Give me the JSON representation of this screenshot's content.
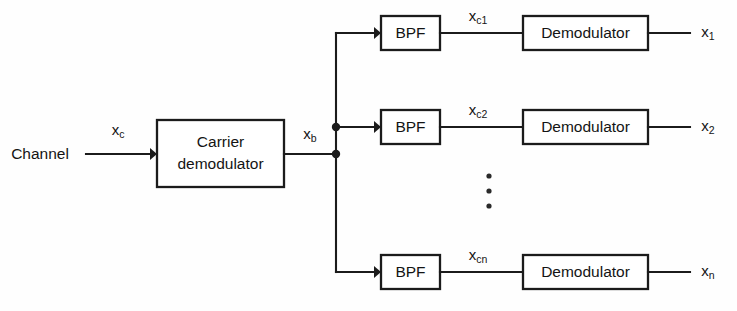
{
  "diagram": {
    "background_color": "#fefefe",
    "line_color": "#1b1b1b",
    "box_fill_color": "#ffffff",
    "input": {
      "source_label": "Channel",
      "signal_label": "x",
      "signal_subscript": "c"
    },
    "carrier_stage": {
      "line1": "Carrier",
      "line2": "demodulator",
      "output_signal_label": "x",
      "output_signal_subscript": "b"
    },
    "branch_filter_label": "BPF",
    "branch_demodulator_label": "Demodulator",
    "ellipsis_symbol": "vertical-ellipsis",
    "branches": [
      {
        "filter_label": "BPF",
        "demodulator_label": "Demodulator",
        "filtered_signal_label": "x",
        "filtered_signal_subscript": "c1",
        "output_signal_label": "x",
        "output_signal_subscript": "1"
      },
      {
        "filter_label": "BPF",
        "demodulator_label": "Demodulator",
        "filtered_signal_label": "x",
        "filtered_signal_subscript": "c2",
        "output_signal_label": "x",
        "output_signal_subscript": "2"
      },
      {
        "filter_label": "BPF",
        "demodulator_label": "Demodulator",
        "filtered_signal_label": "x",
        "filtered_signal_subscript": "cn",
        "output_signal_label": "x",
        "output_signal_subscript": "n"
      }
    ]
  }
}
